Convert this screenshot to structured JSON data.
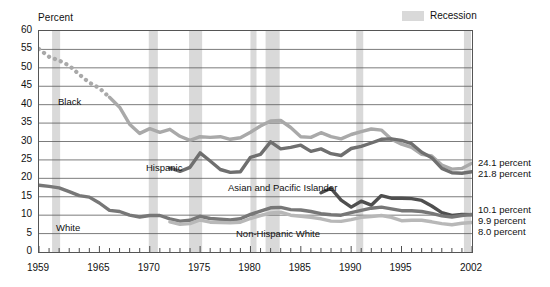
{
  "axis_title": "Percent",
  "legend": {
    "label": "Recession",
    "swatch_color": "#d9d9d9"
  },
  "series_labels": {
    "black": "Black",
    "hispanic": "Hispanic",
    "asian": "Asian and Pacific Islander",
    "white": "White",
    "nhwhite": "Non-Hispanic White"
  },
  "end_values": [
    {
      "text": "24.1 percent"
    },
    {
      "text": "21.8 percent"
    },
    {
      "text": "10.1 percent"
    },
    {
      "text": "9.9 percent"
    },
    {
      "text": "8.0 percent"
    }
  ],
  "chart_data": {
    "type": "line",
    "title": "",
    "xlabel": "",
    "ylabel": "Percent",
    "xlim": [
      1959,
      2002
    ],
    "ylim": [
      0,
      60
    ],
    "ytick_step": 5,
    "yticks": [
      0,
      5,
      10,
      15,
      20,
      25,
      30,
      35,
      40,
      45,
      50,
      55,
      60
    ],
    "xtick_labels": [
      "1959",
      "1965",
      "1970",
      "1975",
      "1980",
      "1985",
      "1990",
      "1995",
      "2002"
    ],
    "xtick_values": [
      1959,
      1965,
      1970,
      1975,
      1980,
      1985,
      1990,
      1995,
      2002
    ],
    "grid": "horizontal",
    "legend_position": "top-right",
    "recessions": [
      {
        "start": 1960.3,
        "end": 1961.1
      },
      {
        "start": 1969.9,
        "end": 1970.8
      },
      {
        "start": 1973.9,
        "end": 1975.2
      },
      {
        "start": 1980.0,
        "end": 1980.6
      },
      {
        "start": 1981.5,
        "end": 1982.9
      },
      {
        "start": 1990.5,
        "end": 1991.2
      },
      {
        "start": 2001.2,
        "end": 2001.9
      }
    ],
    "series": [
      {
        "name": "Black",
        "color": "#a9a9a9",
        "style_segments": [
          {
            "from": 1959,
            "to": 1966,
            "style": "dotted"
          },
          {
            "from": 1966,
            "to": 2002,
            "style": "solid"
          }
        ],
        "x": [
          1959,
          1960,
          1961,
          1962,
          1963,
          1964,
          1965,
          1966,
          1967,
          1968,
          1969,
          1970,
          1971,
          1972,
          1973,
          1974,
          1975,
          1976,
          1977,
          1978,
          1979,
          1980,
          1981,
          1982,
          1983,
          1984,
          1985,
          1986,
          1987,
          1988,
          1989,
          1990,
          1991,
          1992,
          1993,
          1994,
          1995,
          1996,
          1997,
          1998,
          1999,
          2000,
          2001,
          2002
        ],
        "values": [
          55.1,
          53.0,
          52.0,
          50.6,
          48.2,
          46.0,
          44.5,
          42.0,
          39.3,
          34.7,
          32.2,
          33.5,
          32.5,
          33.3,
          31.4,
          30.3,
          31.3,
          31.1,
          31.3,
          30.6,
          31.0,
          32.5,
          34.2,
          35.6,
          35.7,
          33.8,
          31.3,
          31.1,
          32.4,
          31.3,
          30.7,
          31.9,
          32.7,
          33.4,
          33.1,
          30.6,
          29.3,
          28.4,
          26.5,
          26.1,
          23.6,
          22.5,
          22.7,
          24.1
        ]
      },
      {
        "name": "Hispanic",
        "color": "#6f6f6f",
        "style_segments": [
          {
            "from": 1972,
            "to": 2002,
            "style": "solid"
          }
        ],
        "x": [
          1972,
          1973,
          1974,
          1975,
          1976,
          1977,
          1978,
          1979,
          1980,
          1981,
          1982,
          1983,
          1984,
          1985,
          1986,
          1987,
          1988,
          1989,
          1990,
          1991,
          1992,
          1993,
          1994,
          1995,
          1996,
          1997,
          1998,
          1999,
          2000,
          2001,
          2002
        ],
        "values": [
          22.8,
          21.9,
          23.0,
          26.9,
          24.7,
          22.4,
          21.6,
          21.8,
          25.7,
          26.5,
          29.9,
          28.0,
          28.4,
          29.0,
          27.3,
          28.0,
          26.7,
          26.2,
          28.1,
          28.7,
          29.6,
          30.6,
          30.7,
          30.3,
          29.4,
          27.1,
          25.6,
          22.7,
          21.5,
          21.4,
          21.8
        ]
      },
      {
        "name": "Asian and Pacific Islander",
        "color": "#4f4f4f",
        "style_segments": [
          {
            "from": 1987,
            "to": 2002,
            "style": "solid"
          }
        ],
        "x": [
          1987,
          1988,
          1989,
          1990,
          1991,
          1992,
          1993,
          1994,
          1995,
          1996,
          1997,
          1998,
          1999,
          2000,
          2001,
          2002
        ],
        "values": [
          16.1,
          17.3,
          14.1,
          12.2,
          13.8,
          12.7,
          15.3,
          14.6,
          14.6,
          14.5,
          14.0,
          12.5,
          10.7,
          9.9,
          10.2,
          10.1
        ]
      },
      {
        "name": "White",
        "color": "#777777",
        "style_segments": [
          {
            "from": 1959,
            "to": 2002,
            "style": "solid"
          }
        ],
        "x": [
          1959,
          1960,
          1961,
          1962,
          1963,
          1964,
          1965,
          1966,
          1967,
          1968,
          1969,
          1970,
          1971,
          1972,
          1973,
          1974,
          1975,
          1976,
          1977,
          1978,
          1979,
          1980,
          1981,
          1982,
          1983,
          1984,
          1985,
          1986,
          1987,
          1988,
          1989,
          1990,
          1991,
          1992,
          1993,
          1994,
          1995,
          1996,
          1997,
          1998,
          1999,
          2000,
          2001,
          2002
        ],
        "values": [
          18.1,
          17.8,
          17.4,
          16.4,
          15.3,
          14.9,
          13.3,
          11.3,
          11.0,
          10.0,
          9.5,
          9.9,
          9.9,
          9.0,
          8.4,
          8.6,
          9.7,
          9.1,
          8.9,
          8.7,
          9.0,
          10.2,
          11.1,
          12.0,
          12.1,
          11.5,
          11.4,
          11.0,
          10.4,
          10.1,
          10.0,
          10.7,
          11.3,
          11.9,
          12.2,
          11.7,
          11.2,
          11.2,
          11.0,
          10.5,
          9.8,
          9.5,
          9.9,
          10.2
        ]
      },
      {
        "name": "Non-Hispanic White",
        "color": "#b8b8b8",
        "style_segments": [
          {
            "from": 1972,
            "to": 2002,
            "style": "solid"
          }
        ],
        "x": [
          1972,
          1973,
          1974,
          1975,
          1976,
          1977,
          1978,
          1979,
          1980,
          1981,
          1982,
          1983,
          1984,
          1985,
          1986,
          1987,
          1988,
          1989,
          1990,
          1991,
          1992,
          1993,
          1994,
          1995,
          1996,
          1997,
          1998,
          1999,
          2000,
          2001,
          2002
        ],
        "values": [
          8.2,
          7.5,
          7.7,
          8.7,
          8.1,
          8.0,
          7.9,
          8.1,
          9.1,
          9.9,
          10.6,
          10.8,
          10.0,
          9.7,
          9.4,
          9.0,
          8.4,
          8.3,
          8.8,
          9.4,
          9.6,
          9.9,
          9.4,
          8.5,
          8.6,
          8.6,
          8.2,
          7.7,
          7.4,
          7.8,
          8.0
        ]
      }
    ]
  }
}
